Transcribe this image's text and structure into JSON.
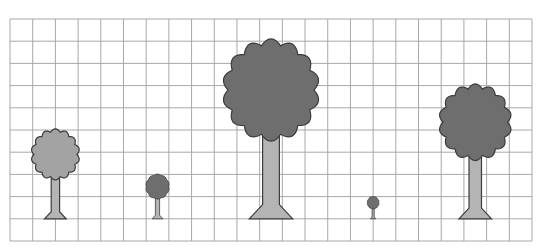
{
  "figure": {
    "grid": {
      "columns": 23,
      "rows": 10,
      "line_color": "#a8a8a8",
      "background": "#ffffff"
    },
    "colors": {
      "crown_dark": "#6e6e6e",
      "crown_light": "#a3a3a3",
      "trunk": "#b4b4b4",
      "outline": "#3c3c3c"
    },
    "trees": [
      {
        "id": "tree-1",
        "label": "medium tree (light crown)",
        "crown_shade": "light",
        "col": 2.0,
        "height_cells": 4.0
      },
      {
        "id": "tree-2",
        "label": "small tree",
        "crown_shade": "dark",
        "col": 6.5,
        "height_cells": 2.0
      },
      {
        "id": "tree-3",
        "label": "tallest tree",
        "crown_shade": "dark",
        "col": 11.5,
        "height_cells": 8.0
      },
      {
        "id": "tree-4",
        "label": "tiny tree",
        "crown_shade": "dark",
        "col": 16.0,
        "height_cells": 1.0
      },
      {
        "id": "tree-5",
        "label": "large tree",
        "crown_shade": "dark",
        "col": 20.5,
        "height_cells": 6.0
      }
    ]
  }
}
